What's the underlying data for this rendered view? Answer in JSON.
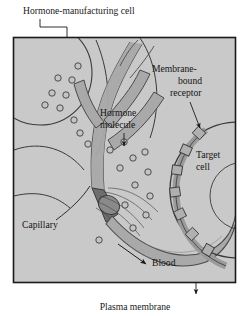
{
  "figure": {
    "type": "biology-diagram",
    "frame": {
      "x": 13,
      "y": 37,
      "width": 223,
      "height": 246,
      "border_color": "#1a1a1a",
      "fill_color": "#c9c9c9"
    },
    "background_color": "#ffffff"
  },
  "labels": {
    "hormone_manufacturing_cell": "Hormone-manufacturing cell",
    "membrane_bound_receptor_line1": "Membrane-",
    "membrane_bound_receptor_line2": "bound",
    "membrane_bound_receptor_line3": "receptor",
    "hormone_molecule_line1": "Hormone",
    "hormone_molecule_line2": "molecule",
    "target_cell_line1": "Target",
    "target_cell_line2": "cell",
    "capillary": "Capillary",
    "blood": "Blood",
    "plasma_membrane": "Plasma membrane"
  },
  "colors": {
    "panel_fill": "#c9c9c9",
    "vessel_fill": "#a9a9a9",
    "vessel_stroke": "#4a4a4a",
    "molecule_fill": "#c0c0c0",
    "molecule_stroke": "#3d3d3d",
    "receptor_fill": "#b0b0b0",
    "dark_junction": "#6b6b6b",
    "outline": "#2a2a2a",
    "text": "#1a1a1a"
  },
  "elements": {
    "hormone_molecules": [
      {
        "cx": 78,
        "cy": 66,
        "r": 3.2
      },
      {
        "cx": 58,
        "cy": 78,
        "r": 3.2
      },
      {
        "cx": 72,
        "cy": 80,
        "r": 3.2
      },
      {
        "cx": 52,
        "cy": 93,
        "r": 3.2
      },
      {
        "cx": 66,
        "cy": 95,
        "r": 3.2
      },
      {
        "cx": 45,
        "cy": 105,
        "r": 3.2
      },
      {
        "cx": 60,
        "cy": 108,
        "r": 3.2
      },
      {
        "cx": 74,
        "cy": 120,
        "r": 3.2
      },
      {
        "cx": 80,
        "cy": 133,
        "r": 3.2
      },
      {
        "cx": 88,
        "cy": 144,
        "r": 3.2
      },
      {
        "cx": 110,
        "cy": 150,
        "r": 3.2
      },
      {
        "cx": 124,
        "cy": 142,
        "r": 3.2
      },
      {
        "cx": 133,
        "cy": 158,
        "r": 3.2
      },
      {
        "cx": 120,
        "cy": 168,
        "r": 3.2
      },
      {
        "cx": 145,
        "cy": 152,
        "r": 3.2
      },
      {
        "cx": 148,
        "cy": 172,
        "r": 3.2
      },
      {
        "cx": 135,
        "cy": 185,
        "r": 3.2
      },
      {
        "cx": 150,
        "cy": 196,
        "r": 3.2
      },
      {
        "cx": 125,
        "cy": 205,
        "r": 3.2
      },
      {
        "cx": 146,
        "cy": 215,
        "r": 3.2
      },
      {
        "cx": 133,
        "cy": 228,
        "r": 3.2
      },
      {
        "cx": 99,
        "cy": 240,
        "r": 3.2
      }
    ],
    "receptors": [
      {
        "x": 196,
        "y": 130,
        "rot": 38
      },
      {
        "x": 184,
        "y": 147,
        "rot": 20
      },
      {
        "x": 175,
        "y": 166,
        "rot": 5
      },
      {
        "x": 172,
        "y": 187,
        "rot": -8
      },
      {
        "x": 176,
        "y": 208,
        "rot": -22
      },
      {
        "x": 186,
        "y": 228,
        "rot": -40
      },
      {
        "x": 200,
        "y": 244,
        "rot": -55
      }
    ],
    "callouts": [
      {
        "name": "hormone-manufacturing-cell",
        "kind": "arrow"
      },
      {
        "name": "hormone-molecule",
        "kind": "arrow"
      },
      {
        "name": "membrane-bound-receptor",
        "kind": "leader"
      },
      {
        "name": "target-cell",
        "kind": "text-only"
      },
      {
        "name": "capillary",
        "kind": "leader"
      },
      {
        "name": "blood",
        "kind": "arrow"
      },
      {
        "name": "plasma-membrane",
        "kind": "leader"
      }
    ]
  }
}
